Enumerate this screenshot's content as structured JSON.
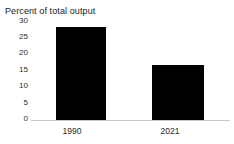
{
  "chart_data": {
    "type": "bar",
    "title": "Percent of total output",
    "subtitle": "",
    "xlabel": "",
    "ylabel": "",
    "categories": [
      "1990",
      "2021"
    ],
    "values": [
      28,
      16.6
    ],
    "ylim": [
      0,
      30
    ],
    "yticks": [
      0,
      5,
      10,
      15,
      20,
      25,
      30
    ],
    "ytick_labels": [
      "0",
      "5",
      "10",
      "15",
      "20",
      "25",
      "30"
    ],
    "grid": false,
    "legend": null,
    "bar_color": "#000000",
    "axis_color": "#c9c9c9",
    "text_color": "#2b2b2b",
    "background": "#ffffff"
  }
}
